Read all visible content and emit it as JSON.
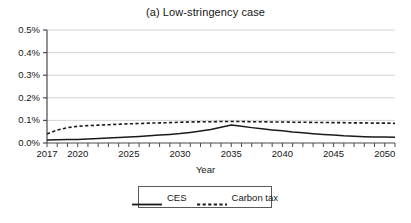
{
  "chart_data": {
    "type": "line",
    "title": "(a) Low-stringency case",
    "xlabel": "Year",
    "ylabel": "",
    "xlim": [
      2017,
      2051
    ],
    "ylim": [
      0.0,
      0.5
    ],
    "grid": true,
    "legend_position": "bottom",
    "ytick_labels": [
      "0.0%",
      "0.1%",
      "0.2%",
      "0.3%",
      "0.4%",
      "0.5%"
    ],
    "ytick_values": [
      0.0,
      0.1,
      0.2,
      0.3,
      0.4,
      0.5
    ],
    "xtick_labels": [
      "2017",
      "2020",
      "2025",
      "2030",
      "2035",
      "2040",
      "2045",
      "2050"
    ],
    "xtick_values": [
      2017,
      2020,
      2025,
      2030,
      2035,
      2040,
      2045,
      2050
    ],
    "x": [
      2017,
      2018,
      2019,
      2020,
      2021,
      2022,
      2023,
      2024,
      2025,
      2026,
      2027,
      2028,
      2029,
      2030,
      2031,
      2032,
      2033,
      2034,
      2035,
      2036,
      2037,
      2038,
      2039,
      2040,
      2041,
      2042,
      2043,
      2044,
      2045,
      2046,
      2047,
      2048,
      2049,
      2050,
      2051
    ],
    "series": [
      {
        "name": "CES",
        "style": "solid",
        "color": "#1a1a1a",
        "values": [
          0.013,
          0.014,
          0.015,
          0.016,
          0.018,
          0.02,
          0.022,
          0.024,
          0.026,
          0.029,
          0.032,
          0.035,
          0.038,
          0.042,
          0.047,
          0.053,
          0.06,
          0.07,
          0.08,
          0.074,
          0.068,
          0.063,
          0.058,
          0.054,
          0.049,
          0.045,
          0.041,
          0.038,
          0.035,
          0.032,
          0.03,
          0.028,
          0.027,
          0.026,
          0.025
        ]
      },
      {
        "name": "Carbon tax",
        "style": "dotted",
        "color": "#1a1a1a",
        "values": [
          0.04,
          0.057,
          0.068,
          0.074,
          0.077,
          0.079,
          0.081,
          0.083,
          0.085,
          0.086,
          0.088,
          0.089,
          0.09,
          0.092,
          0.093,
          0.094,
          0.094,
          0.095,
          0.095,
          0.095,
          0.094,
          0.094,
          0.093,
          0.093,
          0.092,
          0.092,
          0.091,
          0.091,
          0.09,
          0.09,
          0.089,
          0.089,
          0.088,
          0.088,
          0.087
        ]
      }
    ]
  },
  "legend": {
    "items": [
      {
        "label": "CES",
        "style": "solid"
      },
      {
        "label": "Carbon tax",
        "style": "dotted"
      }
    ]
  },
  "colors": {
    "grid": "#d4d4d4",
    "axis": "#4a4a4a",
    "line": "#1a1a1a",
    "background": "#ffffff"
  }
}
